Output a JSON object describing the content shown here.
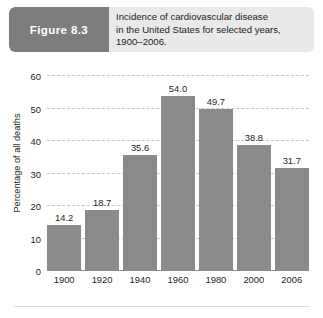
{
  "figure": {
    "tag_label": "Figure  8.3",
    "caption_lines": [
      "Incidence of cardiovascular disease",
      "in the United States for selected years,",
      "1900–2006."
    ]
  },
  "colors": {
    "tag_background": "#7d7d7d",
    "caption_background": "#e9e9e9",
    "bar_fill": "#8a8a8a",
    "gridline": "#c8c8c8",
    "axis": "#8c8c8c",
    "text": "#231f20"
  },
  "chart_data": {
    "type": "bar",
    "title": "",
    "xlabel": "",
    "ylabel": "Percentage of all deaths",
    "categories": [
      "1900",
      "1920",
      "1940",
      "1960",
      "1980",
      "2000",
      "2006"
    ],
    "values": [
      14.2,
      18.7,
      35.6,
      54.0,
      49.7,
      38.8,
      31.7
    ],
    "value_labels": [
      "14.2",
      "18.7",
      "35.6",
      "54.0",
      "49.7",
      "38.8",
      "31.7"
    ],
    "ylim": [
      0,
      60
    ],
    "yticks": [
      0,
      10,
      20,
      30,
      40,
      50,
      60
    ],
    "ytick_labels": [
      "0",
      "10",
      "20",
      "30",
      "40",
      "50",
      "60"
    ],
    "grid": true,
    "legend": false
  }
}
